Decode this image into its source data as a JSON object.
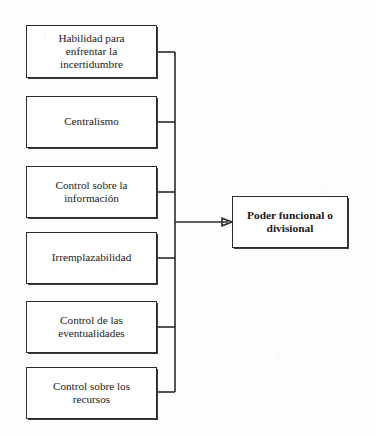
{
  "diagram": {
    "type": "convergence-flow",
    "orientation": "left-to-right",
    "colors": {
      "background": "#fdfdfc",
      "box_fill": "#ffffff",
      "line": "#2b2b2b",
      "text": "#1a1a1a"
    },
    "sources": [
      {
        "id": "habilidad-incertidumbre",
        "label": "Habilidad para\nenfrentar la\nincertidumbre",
        "x": 26,
        "y": 25,
        "width": 131,
        "height": 53
      },
      {
        "id": "centralismo",
        "label": "Centralismo",
        "x": 26,
        "y": 96,
        "width": 131,
        "height": 52
      },
      {
        "id": "control-informacion",
        "label": "Control sobre la\ninformación",
        "x": 26,
        "y": 166,
        "width": 131,
        "height": 52
      },
      {
        "id": "irremplazabilidad",
        "label": "Irremplazabilidad",
        "x": 26,
        "y": 232,
        "width": 131,
        "height": 52
      },
      {
        "id": "control-eventualidades",
        "label": "Control de las\neventualidades",
        "x": 26,
        "y": 301,
        "width": 131,
        "height": 52
      },
      {
        "id": "control-recursos",
        "label": "Control sobre los\nrecursos",
        "x": 26,
        "y": 367,
        "width": 131,
        "height": 52
      }
    ],
    "target": {
      "id": "poder-funcional-divisional",
      "label": "Poder funcional o\ndivisional",
      "x": 232,
      "y": 196,
      "width": 116,
      "height": 52
    },
    "trunk": {
      "x": 175,
      "y_top": 52,
      "y_bottom": 392
    },
    "arrow": {
      "from_x": 175,
      "to_x": 232,
      "y": 222
    }
  }
}
